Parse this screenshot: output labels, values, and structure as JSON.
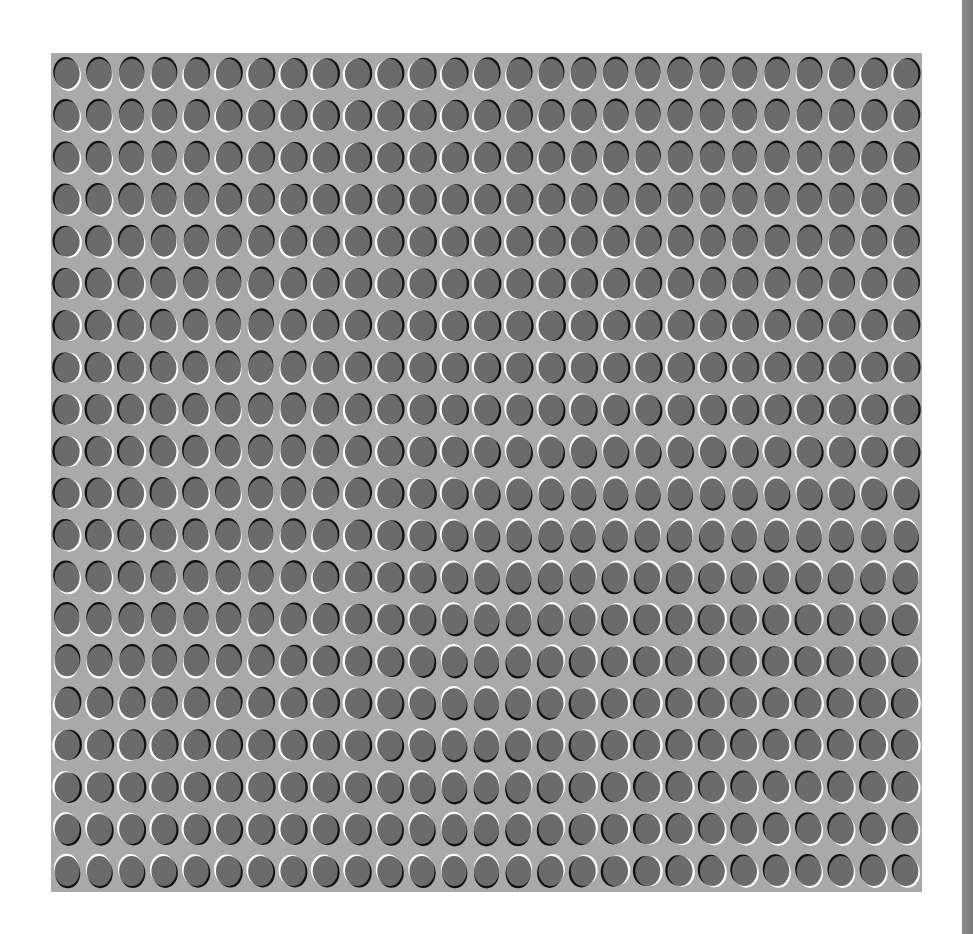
{
  "figure": {
    "grid": {
      "columns": 27,
      "rows": 20
    },
    "colors": {
      "page_background": "#ffffff",
      "panel_background": "#a9a9a9",
      "ellipse_fill": "#6b6b6b",
      "highlight_rim": "#ffffff",
      "shadow_rim": "#111111",
      "edge_strip": "#808080"
    }
  }
}
